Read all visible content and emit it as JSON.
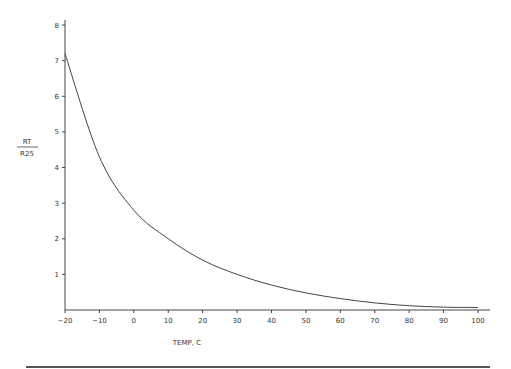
{
  "chart_data": {
    "type": "line",
    "title": "",
    "xlabel": "TEMP, C",
    "ylabel_numerator": "RT",
    "ylabel_denominator": "R25",
    "xlim": [
      -20,
      100
    ],
    "ylim": [
      0,
      8
    ],
    "grid": false,
    "legend": null,
    "x_ticks": [
      -20,
      -10,
      0,
      10,
      20,
      30,
      40,
      50,
      60,
      70,
      80,
      90,
      100
    ],
    "y_ticks": [
      1,
      2,
      3,
      4,
      5,
      6,
      7,
      8
    ],
    "x": [
      -20,
      -10,
      0,
      10,
      20,
      30,
      40,
      50,
      60,
      70,
      80,
      90,
      100
    ],
    "series": [
      {
        "name": "RT/R25",
        "values": [
          7.2,
          4.3,
          2.8,
          2.0,
          1.4,
          1.0,
          0.7,
          0.48,
          0.32,
          0.2,
          0.12,
          0.08,
          0.07
        ]
      }
    ]
  }
}
